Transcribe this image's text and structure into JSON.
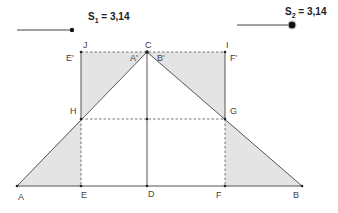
{
  "sliders": [
    {
      "name": "S",
      "sub": "1",
      "value": "3,14",
      "line": {
        "x1": 17,
        "y1": 30,
        "x2": 72,
        "y2": 30
      },
      "handle": {
        "x": 72,
        "y": 30,
        "r": 2.2
      },
      "label_pos": {
        "x": 88,
        "y": 11
      }
    },
    {
      "name": "S",
      "sub": "2",
      "value": "3,14",
      "line": {
        "x1": 237,
        "y1": 25,
        "x2": 292,
        "y2": 25
      },
      "handle": {
        "x": 292,
        "y": 25,
        "r": 3.3
      },
      "label_pos": {
        "x": 285,
        "y": 6
      }
    }
  ],
  "points": {
    "A": {
      "x": 17,
      "y": 186
    },
    "B": {
      "x": 302,
      "y": 186
    },
    "C": {
      "x": 147,
      "y": 52
    },
    "D": {
      "x": 147,
      "y": 186
    },
    "E": {
      "x": 81,
      "y": 186
    },
    "F": {
      "x": 225,
      "y": 186
    },
    "G": {
      "x": 225,
      "y": 119
    },
    "H": {
      "x": 81,
      "y": 119
    },
    "I": {
      "x": 225,
      "y": 52
    },
    "J": {
      "x": 81,
      "y": 52
    }
  },
  "labels": [
    {
      "text": "J",
      "x": 83,
      "y": 40
    },
    {
      "text": "E'",
      "x": 66,
      "y": 53
    },
    {
      "text": "C",
      "x": 145,
      "y": 40
    },
    {
      "text": "A'",
      "x": 130,
      "y": 53
    },
    {
      "text": "B'",
      "x": 157,
      "y": 53
    },
    {
      "text": "I",
      "x": 226,
      "y": 40
    },
    {
      "text": "F'",
      "x": 230,
      "y": 53
    },
    {
      "text": "H",
      "x": 70,
      "y": 106
    },
    {
      "text": "G",
      "x": 230,
      "y": 106
    },
    {
      "text": "A",
      "x": 18,
      "y": 192
    },
    {
      "text": "E",
      "x": 81,
      "y": 190
    },
    {
      "text": "D",
      "x": 148,
      "y": 189
    },
    {
      "text": "F",
      "x": 216,
      "y": 190
    },
    {
      "text": "B",
      "x": 293,
      "y": 190
    }
  ],
  "colors": {
    "fill": "#e4e4e4",
    "line": "#555555",
    "dashed": "#555555",
    "point": "#222222"
  }
}
